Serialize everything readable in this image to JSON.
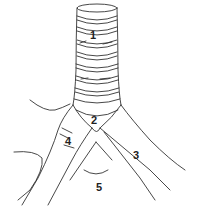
{
  "figure": {
    "labels": [
      {
        "id": "1",
        "text": "1",
        "x": 90,
        "y": 30
      },
      {
        "id": "2",
        "text": "2",
        "x": 91,
        "y": 115
      },
      {
        "id": "3",
        "text": "3",
        "x": 133,
        "y": 150
      },
      {
        "id": "4",
        "text": "4",
        "x": 65,
        "y": 136
      },
      {
        "id": "5",
        "text": "5",
        "x": 96,
        "y": 182
      }
    ],
    "colors": {
      "line": "#333333",
      "background": "#ffffff",
      "label": "#222222"
    }
  }
}
